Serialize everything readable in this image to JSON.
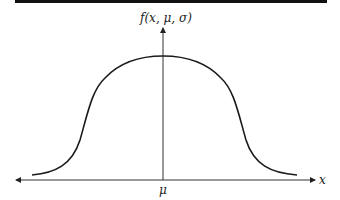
{
  "diagram": {
    "type": "bell-shaped curve (flat-topped generalized normal distribution)",
    "y_axis_label": "f(x, μ, σ)",
    "x_axis_label": "x",
    "center_label": "μ"
  },
  "colors": {
    "line": "#1a1a1a",
    "axis": "#333333",
    "background": "#ffffff",
    "top_bar": "#111111"
  }
}
